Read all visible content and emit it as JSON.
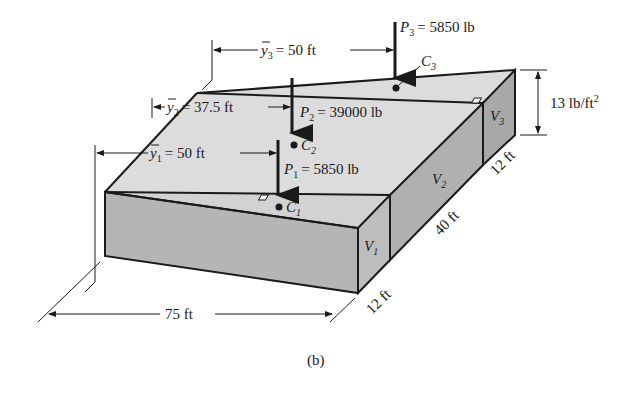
{
  "figure": {
    "caption": "(b)",
    "loads": [
      {
        "name": "P1",
        "symbol": "P",
        "sub": "1",
        "value": "= 5850 lb",
        "centroid": "C",
        "centroid_sub": "1"
      },
      {
        "name": "P2",
        "symbol": "P",
        "sub": "2",
        "value": "= 39000 lb",
        "centroid": "C",
        "centroid_sub": "2"
      },
      {
        "name": "P3",
        "symbol": "P",
        "sub": "3",
        "value": "= 5850 lb",
        "centroid": "C",
        "centroid_sub": "3"
      }
    ],
    "distances": [
      {
        "symbol": "y",
        "sub": "1",
        "value": "= 50 ft"
      },
      {
        "symbol": "y",
        "sub": "2",
        "value": "= 37.5 ft"
      },
      {
        "symbol": "y",
        "sub": "3",
        "value": "= 50 ft"
      }
    ],
    "volumes": [
      {
        "symbol": "V",
        "sub": "1"
      },
      {
        "symbol": "V",
        "sub": "2"
      },
      {
        "symbol": "V",
        "sub": "3"
      }
    ],
    "dimensions": {
      "length": "75 ft",
      "width_1": "12 ft",
      "width_2": "40 ft",
      "width_3": "12 ft",
      "height": "13 lb/ft",
      "height_exp": "2"
    },
    "colors": {
      "top_face": "#d9d9d9",
      "front_face": "#b3b3b3",
      "side_face": "#a6a6a6",
      "stroke": "#1a1a1a"
    }
  }
}
